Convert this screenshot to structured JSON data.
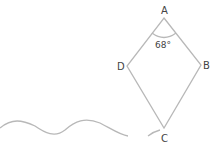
{
  "diagram": {
    "type": "kite",
    "vertices": {
      "A": {
        "label": "A",
        "x": 164,
        "y": 18
      },
      "B": {
        "label": "B",
        "x": 201,
        "y": 65
      },
      "C": {
        "label": "C",
        "x": 164,
        "y": 128
      },
      "D": {
        "label": "D",
        "x": 127,
        "y": 66
      }
    },
    "angle_label": "68°",
    "line_color": "#bbbbbb",
    "text_color": "#444444"
  }
}
